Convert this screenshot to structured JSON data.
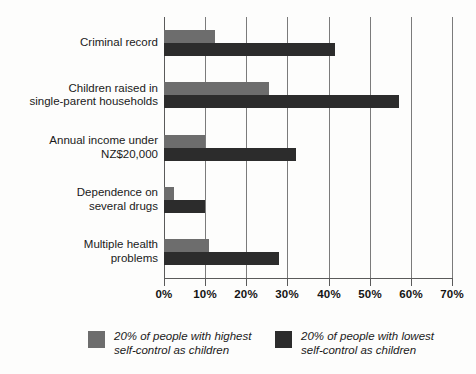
{
  "chart_data": {
    "type": "bar",
    "orientation": "horizontal",
    "title": "",
    "subtitle": "",
    "xlabel": "",
    "ylabel": "",
    "xlim": [
      0,
      70
    ],
    "grid": true,
    "grid_axis": "x",
    "legend_position": "bottom",
    "categories": [
      "Criminal record",
      "Children raised in\nsingle-parent households",
      "Annual income under\nNZ$20,000",
      "Dependence on\nseveral drugs",
      "Multiple health\nproblems"
    ],
    "tick_labels": [
      "0%",
      "10%",
      "20%",
      "30%",
      "40%",
      "50%",
      "60%",
      "70%"
    ],
    "tick_values": [
      0,
      10,
      20,
      30,
      40,
      50,
      60,
      70
    ],
    "series": [
      {
        "name": "20% of people with highest self-control as children",
        "color": "#6d6d6d",
        "values": [
          12.5,
          25.5,
          10,
          2.5,
          11
        ]
      },
      {
        "name": "20% of people with lowest self-control as children",
        "color": "#2c2c2c",
        "values": [
          41.5,
          57,
          32,
          10,
          28
        ]
      }
    ]
  },
  "legend": {
    "items": [
      {
        "swatch": "high",
        "line1_prefix": "20% of people with ",
        "line1_emphasis": "highest",
        "line2": "self-control as children",
        "full": "20% of people with highest\nself-control as children"
      },
      {
        "swatch": "low",
        "line1_prefix": "20% of people with ",
        "line1_emphasis": "lowest",
        "line2": "self-control as children",
        "full": "20% of people with lowest\nself-control as children"
      }
    ]
  },
  "colors": {
    "highest_self_control": "#6d6d6d",
    "lowest_self_control": "#2c2c2c",
    "gridline": "#7b7b7b",
    "axis": "#5a5a5a",
    "background": "#fdfdfc",
    "text": "#1a1a1a"
  }
}
